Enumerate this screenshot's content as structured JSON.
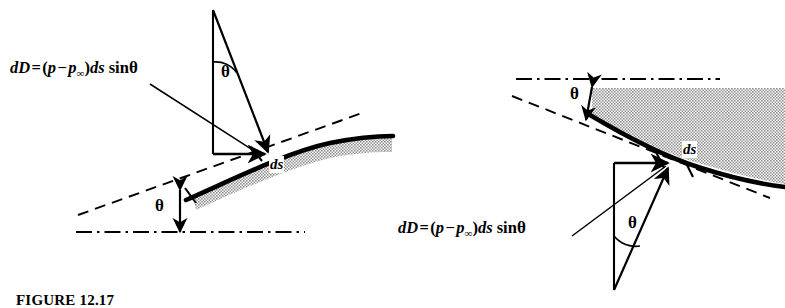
{
  "figure": {
    "caption": "FIGURE 12.17",
    "background_color": "#ffffff",
    "ink_color": "#000000",
    "shading_color": "#9a9a9a"
  },
  "equation": {
    "lead": "dD",
    "equals": "=",
    "open": "(",
    "p": "p",
    "minus": "−",
    "p_inf": "p",
    "inf": "∞",
    "close": ")",
    "ds": "ds",
    "sin": "sin",
    "theta": "θ",
    "full_text": "dD = (p − p∞)ds sinθ"
  },
  "panels": [
    {
      "id": "upper-surface",
      "name": "left-diagram",
      "equation_label": "dD = (p − p∞)ds sinθ",
      "surface_label": "ds",
      "angle_label_force": "θ",
      "angle_label_surface": "θ",
      "chord_line_style": "dash-dot",
      "tangent_line_style": "dashed"
    },
    {
      "id": "lower-surface",
      "name": "right-diagram",
      "equation_label": "dD = (p − p∞)ds sinθ",
      "surface_label": "ds",
      "angle_label_force": "θ",
      "angle_label_surface": "θ",
      "chord_line_style": "dash-dot",
      "tangent_line_style": "dashed"
    }
  ]
}
